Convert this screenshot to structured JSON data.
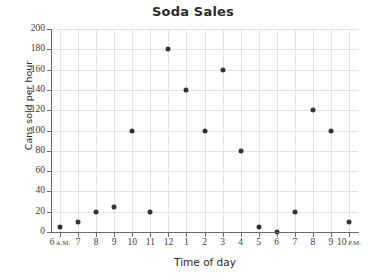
{
  "chart_data": {
    "type": "scatter",
    "title": "Soda Sales",
    "xlabel": "Time of day",
    "ylabel": "Cans sold per hour",
    "x_tick_labels": [
      {
        "number": "6",
        "meridiem": "A.M."
      },
      {
        "number": "7",
        "meridiem": ""
      },
      {
        "number": "8",
        "meridiem": ""
      },
      {
        "number": "9",
        "meridiem": ""
      },
      {
        "number": "10",
        "meridiem": ""
      },
      {
        "number": "11",
        "meridiem": ""
      },
      {
        "number": "12",
        "meridiem": ""
      },
      {
        "number": "1",
        "meridiem": ""
      },
      {
        "number": "2",
        "meridiem": ""
      },
      {
        "number": "3",
        "meridiem": ""
      },
      {
        "number": "4",
        "meridiem": ""
      },
      {
        "number": "5",
        "meridiem": ""
      },
      {
        "number": "6",
        "meridiem": ""
      },
      {
        "number": "7",
        "meridiem": ""
      },
      {
        "number": "8",
        "meridiem": ""
      },
      {
        "number": "9",
        "meridiem": ""
      },
      {
        "number": "10",
        "meridiem": "P.M."
      }
    ],
    "categories": [
      "6 A.M.",
      "7",
      "8",
      "9",
      "10",
      "11",
      "12",
      "1",
      "2",
      "3",
      "4",
      "5",
      "6",
      "7",
      "8",
      "9",
      "10 P.M."
    ],
    "x": [
      6,
      7,
      8,
      9,
      10,
      11,
      12,
      13,
      14,
      15,
      16,
      17,
      18,
      19,
      20,
      21,
      22
    ],
    "values": [
      5,
      10,
      20,
      25,
      100,
      20,
      180,
      140,
      100,
      160,
      80,
      5,
      0,
      20,
      120,
      100,
      10
    ],
    "y_tick_labels": [
      "0",
      "20",
      "40",
      "60",
      "80",
      "100",
      "120",
      "140",
      "160",
      "180",
      "200"
    ],
    "y_ticks": [
      0,
      20,
      40,
      60,
      80,
      100,
      120,
      140,
      160,
      180,
      200
    ],
    "ylim": [
      0,
      200
    ],
    "xlim": [
      5.5,
      22.5
    ],
    "grid": true,
    "legend": false,
    "marker_color": "#333336",
    "grid_color": "#e2e2e4",
    "axis_color": "#6b6b6b",
    "text_color": "#2b2b2b"
  }
}
